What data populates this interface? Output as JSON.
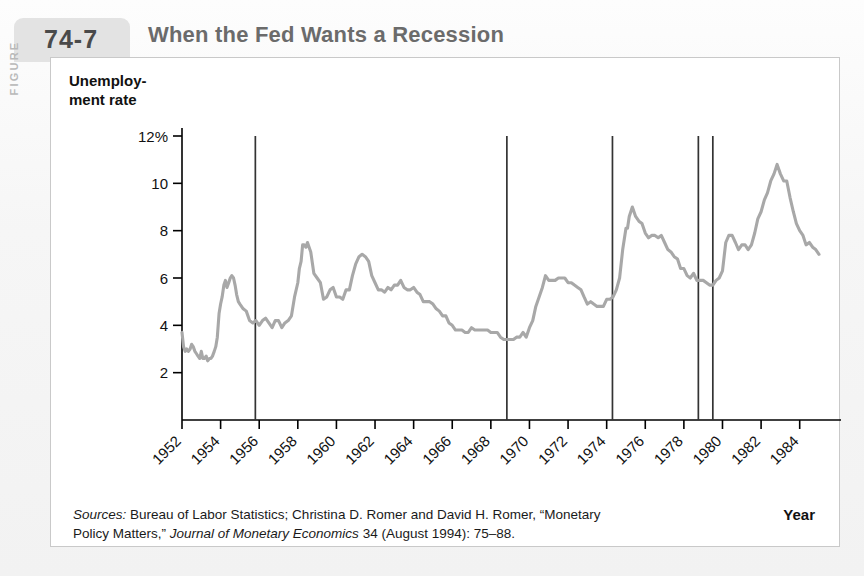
{
  "figure": {
    "label": "FIGURE",
    "number": "74-7",
    "title": "When the Fed Wants a Recession"
  },
  "chart_data": {
    "type": "line",
    "title": "When the Fed Wants a Recession",
    "xlabel": "Year",
    "ylabel": "Unemploy-\nment rate",
    "ylim": [
      0,
      12
    ],
    "xlim": [
      1952,
      1985
    ],
    "grid": false,
    "legend": null,
    "y_ticks": [
      2,
      4,
      6,
      8,
      10,
      12
    ],
    "y_tick_labels": [
      "2",
      "4",
      "6",
      "8",
      "10",
      "12%"
    ],
    "x_ticks": [
      1952,
      1954,
      1956,
      1958,
      1960,
      1962,
      1964,
      1966,
      1968,
      1970,
      1972,
      1974,
      1976,
      1978,
      1980,
      1982,
      1984
    ],
    "x_tick_labels": [
      "1952",
      "1954",
      "1956",
      "1958",
      "1960",
      "1962",
      "1964",
      "1966",
      "1968",
      "1970",
      "1972",
      "1974",
      "1976",
      "1978",
      "1980",
      "1982",
      "1984"
    ],
    "series": [
      {
        "name": "Unemployment rate",
        "color": "#a8a8a8",
        "x": [
          1952.0,
          1952.08,
          1952.17,
          1952.25,
          1952.33,
          1952.42,
          1952.5,
          1952.58,
          1952.67,
          1952.75,
          1952.83,
          1952.92,
          1953.0,
          1953.08,
          1953.17,
          1953.25,
          1953.33,
          1953.42,
          1953.5,
          1953.58,
          1953.67,
          1953.75,
          1953.83,
          1953.92,
          1954.0,
          1954.08,
          1954.17,
          1954.25,
          1954.33,
          1954.42,
          1954.5,
          1954.58,
          1954.67,
          1954.75,
          1954.83,
          1954.92,
          1955.0,
          1955.17,
          1955.33,
          1955.5,
          1955.67,
          1955.83,
          1956.0,
          1956.17,
          1956.33,
          1956.5,
          1956.67,
          1956.83,
          1957.0,
          1957.17,
          1957.33,
          1957.5,
          1957.67,
          1957.83,
          1958.0,
          1958.08,
          1958.17,
          1958.25,
          1958.33,
          1958.42,
          1958.5,
          1958.67,
          1958.83,
          1959.0,
          1959.17,
          1959.33,
          1959.5,
          1959.67,
          1959.83,
          1960.0,
          1960.17,
          1960.33,
          1960.5,
          1960.67,
          1960.83,
          1961.0,
          1961.17,
          1961.33,
          1961.5,
          1961.67,
          1961.83,
          1962.0,
          1962.17,
          1962.33,
          1962.5,
          1962.67,
          1962.83,
          1963.0,
          1963.17,
          1963.33,
          1963.5,
          1963.67,
          1963.83,
          1964.0,
          1964.17,
          1964.33,
          1964.5,
          1964.67,
          1964.83,
          1965.0,
          1965.17,
          1965.33,
          1965.5,
          1965.67,
          1965.83,
          1966.0,
          1966.17,
          1966.33,
          1966.5,
          1966.67,
          1966.83,
          1967.0,
          1967.17,
          1967.33,
          1967.5,
          1967.67,
          1967.83,
          1968.0,
          1968.17,
          1968.33,
          1968.5,
          1968.67,
          1968.83,
          1969.0,
          1969.17,
          1969.33,
          1969.5,
          1969.67,
          1969.83,
          1970.0,
          1970.17,
          1970.33,
          1970.5,
          1970.67,
          1970.83,
          1971.0,
          1971.17,
          1971.33,
          1971.5,
          1971.67,
          1971.83,
          1972.0,
          1972.17,
          1972.33,
          1972.5,
          1972.67,
          1972.83,
          1973.0,
          1973.17,
          1973.33,
          1973.5,
          1973.67,
          1973.83,
          1974.0,
          1974.17,
          1974.33,
          1974.5,
          1974.67,
          1974.83,
          1975.0,
          1975.08,
          1975.17,
          1975.25,
          1975.33,
          1975.5,
          1975.67,
          1975.83,
          1976.0,
          1976.17,
          1976.33,
          1976.5,
          1976.67,
          1976.83,
          1977.0,
          1977.17,
          1977.33,
          1977.5,
          1977.67,
          1977.83,
          1978.0,
          1978.17,
          1978.33,
          1978.5,
          1978.67,
          1978.83,
          1979.0,
          1979.17,
          1979.33,
          1979.5,
          1979.67,
          1979.83,
          1980.0,
          1980.17,
          1980.33,
          1980.5,
          1980.67,
          1980.83,
          1981.0,
          1981.17,
          1981.33,
          1981.5,
          1981.67,
          1981.83,
          1982.0,
          1982.17,
          1982.33,
          1982.5,
          1982.67,
          1982.83,
          1983.0,
          1983.17,
          1983.33,
          1983.5,
          1983.67,
          1983.83,
          1984.0,
          1984.17,
          1984.33,
          1984.5,
          1984.67,
          1984.83,
          1985.0
        ],
        "y": [
          3.7,
          3.1,
          2.9,
          3.0,
          2.9,
          3.0,
          3.2,
          3.1,
          2.9,
          2.8,
          2.7,
          2.6,
          2.9,
          2.6,
          2.6,
          2.7,
          2.5,
          2.6,
          2.6,
          2.7,
          2.9,
          3.1,
          3.5,
          4.5,
          4.9,
          5.2,
          5.7,
          5.9,
          5.6,
          5.8,
          6.0,
          6.1,
          6.0,
          5.7,
          5.3,
          5.0,
          4.9,
          4.7,
          4.6,
          4.2,
          4.1,
          4.2,
          4.0,
          4.2,
          4.3,
          4.1,
          3.9,
          4.2,
          4.2,
          3.9,
          4.1,
          4.2,
          4.4,
          5.2,
          5.8,
          6.4,
          6.7,
          7.4,
          7.4,
          7.3,
          7.5,
          7.1,
          6.2,
          6.0,
          5.8,
          5.1,
          5.2,
          5.5,
          5.6,
          5.2,
          5.2,
          5.1,
          5.5,
          5.5,
          6.1,
          6.6,
          6.9,
          7.0,
          6.9,
          6.7,
          6.1,
          5.8,
          5.5,
          5.5,
          5.4,
          5.6,
          5.5,
          5.7,
          5.7,
          5.9,
          5.6,
          5.5,
          5.5,
          5.6,
          5.4,
          5.3,
          5.0,
          5.0,
          5.0,
          4.9,
          4.7,
          4.6,
          4.4,
          4.4,
          4.1,
          4.0,
          3.8,
          3.8,
          3.8,
          3.7,
          3.7,
          3.9,
          3.8,
          3.8,
          3.8,
          3.8,
          3.8,
          3.7,
          3.7,
          3.7,
          3.5,
          3.4,
          3.4,
          3.4,
          3.4,
          3.5,
          3.5,
          3.7,
          3.5,
          3.9,
          4.2,
          4.8,
          5.2,
          5.6,
          6.1,
          5.9,
          5.9,
          5.9,
          6.0,
          6.0,
          6.0,
          5.8,
          5.8,
          5.7,
          5.6,
          5.5,
          5.2,
          4.9,
          5.0,
          4.9,
          4.8,
          4.8,
          4.8,
          5.1,
          5.1,
          5.2,
          5.5,
          6.0,
          7.2,
          8.1,
          8.1,
          8.6,
          8.8,
          9.0,
          8.6,
          8.4,
          8.3,
          7.9,
          7.7,
          7.8,
          7.8,
          7.7,
          7.8,
          7.5,
          7.2,
          7.1,
          6.9,
          6.8,
          6.4,
          6.4,
          6.1,
          6.0,
          6.2,
          5.9,
          5.9,
          5.9,
          5.8,
          5.7,
          5.7,
          5.9,
          6.0,
          6.3,
          7.5,
          7.8,
          7.8,
          7.5,
          7.2,
          7.4,
          7.4,
          7.2,
          7.4,
          7.9,
          8.5,
          8.8,
          9.3,
          9.6,
          10.1,
          10.4,
          10.8,
          10.4,
          10.1,
          10.1,
          9.4,
          8.8,
          8.3,
          8.0,
          7.8,
          7.4,
          7.5,
          7.3,
          7.2,
          7.0
        ]
      }
    ],
    "vertical_lines": {
      "name": "Romer dates (contractionary monetary policy shocks)",
      "color": "#333333",
      "years": [
        1955.8,
        1968.83,
        1974.3,
        1978.75,
        1979.5
      ],
      "top_value": 12
    }
  },
  "source": {
    "prefix": "Sources:",
    "line1_a": " Bureau of Labor Statistics; Christina D. Romer and David H. Romer, “Monetary",
    "line2_a": "Policy Matters,” ",
    "line2_italic": "Journal of Monetary Economics",
    "line2_b": " 34 (August 1994): 75–88."
  },
  "colors": {
    "line": "#a8a8a8",
    "axis": "#000000",
    "vline": "#333333",
    "title": "#6b6b6b",
    "tab": "#e3e3e3"
  }
}
